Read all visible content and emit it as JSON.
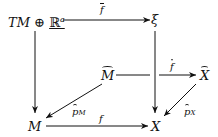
{
  "diagram": {
    "type": "commutative-diagram",
    "nodes": {
      "tm_plus_ra": {
        "base": "TM ⊕ ",
        "field": "ℝ",
        "sup": "a"
      },
      "xi": "ξ",
      "m_hat": "M",
      "x_hat": "X",
      "m": "M",
      "x": "X"
    },
    "arrows": {
      "f_bar": "f",
      "f_hat": "f",
      "p_m_hat": {
        "base": "p",
        "sub": "M"
      },
      "p_x_hat": {
        "base": "p",
        "sub": "X"
      },
      "f": "f"
    },
    "edges": [
      {
        "from": "TM ⊕ ℝ^a",
        "to": "ξ",
        "label": "f̄"
      },
      {
        "from": "TM ⊕ ℝ^a",
        "to": "M",
        "label": ""
      },
      {
        "from": "ξ",
        "to": "X",
        "label": ""
      },
      {
        "from": "M̂",
        "to": "X̂",
        "label": "f̂"
      },
      {
        "from": "M̂",
        "to": "M",
        "label": "p̂_M"
      },
      {
        "from": "X̂",
        "to": "X",
        "label": "p̂_X"
      },
      {
        "from": "M",
        "to": "X",
        "label": "f"
      }
    ]
  }
}
